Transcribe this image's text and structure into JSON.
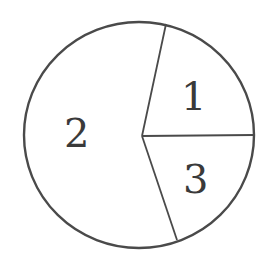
{
  "diagram": {
    "type": "pie",
    "stroke_color": "#4a4a4a",
    "background": "#ffffff",
    "sectors": [
      {
        "label": "1",
        "approx_angle_deg": 78
      },
      {
        "label": "2",
        "approx_angle_deg": 211
      },
      {
        "label": "3",
        "approx_angle_deg": 71
      }
    ]
  }
}
